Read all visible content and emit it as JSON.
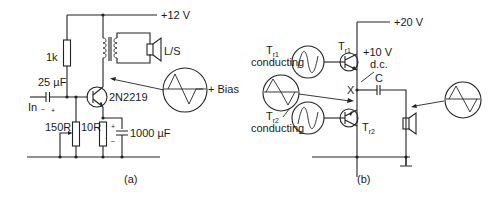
{
  "diagram_a": {
    "caption": "(a)",
    "supply_label": "+12 V",
    "resistor_1k": "1k",
    "speaker_label": "L/S",
    "capacitor_in": "25 µF",
    "input_label": "In",
    "input_minus": "–",
    "input_plus": "+",
    "transistor_label": "2N2219",
    "bias_label": "+ Bias",
    "pot_label": "150R",
    "emitter_resistor": "10R",
    "emitter_cap": "1000 µF",
    "cap_plus": "+",
    "cap_minus": "–"
  },
  "diagram_b": {
    "caption": "(b)",
    "supply_label": "+20 V",
    "tr1_main": "T",
    "tr1_sub": "r1",
    "tr2_main": "T",
    "tr2_sub": "r2",
    "tr1_cond_main": "T",
    "tr1_cond_sub": "r1",
    "tr1_cond_text": "conducting",
    "tr2_cond_main": "T",
    "tr2_cond_sub": "r2",
    "tr2_cond_text": "conducting",
    "midpoint_voltage": "+10 V",
    "midpoint_dc": "d.c.",
    "node_x": "X",
    "capacitor_label": "C"
  }
}
